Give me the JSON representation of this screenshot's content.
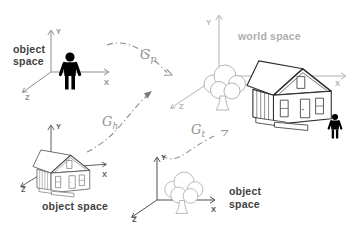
{
  "colors": {
    "background": "#ffffff",
    "axis_gray": "#8f8f8f",
    "axis_medium": "#5f5f5f",
    "axis_dark": "#4f4f4f",
    "axis_light": "#b3b3b3",
    "label_dark": "#3f3f3f",
    "label_light": "#aeaeae",
    "transform_arrow": "#8f8f8f",
    "tree_sketch": "#b5b5b5",
    "house_world": "#2e2e2e",
    "house_object": "#4a4a4a",
    "figure_black": "#000000"
  },
  "labels": {
    "person_space": {
      "line1": "object",
      "line2": "space"
    },
    "house_space": {
      "text": "object space"
    },
    "tree_space": {
      "line1": "object",
      "line2": "space"
    },
    "world_space": {
      "text": "world space"
    }
  },
  "axes": {
    "person_space": {
      "x": "X",
      "y": "Y",
      "z": "Z"
    },
    "house_space": {
      "x": "X",
      "y": "Y",
      "z": "Z"
    },
    "tree_space": {
      "x": "X",
      "y": "Y",
      "z": "Z"
    },
    "world_space": {
      "x": "X",
      "y": "Y",
      "z": "Z"
    }
  },
  "transforms": {
    "person": {
      "base": "G",
      "sub": "p"
    },
    "house": {
      "base": "G",
      "sub": "h"
    },
    "tree": {
      "base": "G",
      "sub": "t"
    }
  },
  "icons": {
    "person": "person-icon",
    "house": "house-icon",
    "tree": "tree-icon"
  }
}
